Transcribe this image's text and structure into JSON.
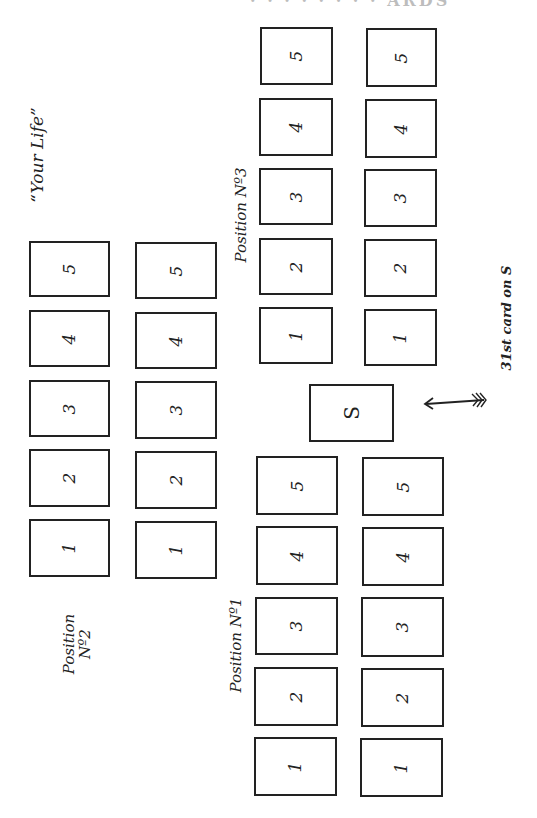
{
  "title_fragment": "· · · · · ·  · ·  ARDS",
  "labels": {
    "your_life": "“Your Life”",
    "position_1": "Position Nº1",
    "position_2_line1": "Position",
    "position_2_line2": "Nº2",
    "position_3": "Position Nº3",
    "annotation": "31st card on S"
  },
  "center_card": {
    "label": "S"
  },
  "positions": {
    "position_1": {
      "row_a": [
        "1",
        "2",
        "3",
        "4",
        "5"
      ],
      "row_b": [
        "1",
        "2",
        "3",
        "4",
        "5"
      ]
    },
    "position_2": {
      "row_a": [
        "1",
        "2",
        "3",
        "4",
        "5"
      ],
      "row_b": [
        "1",
        "2",
        "3",
        "4",
        "5"
      ]
    },
    "position_3": {
      "row_a": [
        "1",
        "2",
        "3",
        "4",
        "5"
      ],
      "row_b": [
        "1",
        "2",
        "3",
        "4",
        "5"
      ]
    }
  }
}
